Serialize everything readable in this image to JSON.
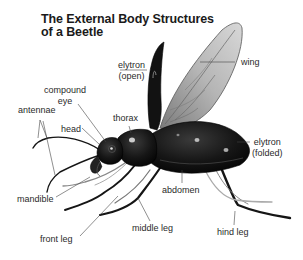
{
  "title": {
    "line1": "The External Body Structures",
    "line2": "of a Beetle"
  },
  "labels": {
    "elytron_open": {
      "line1": "elytron",
      "line2": "(open)"
    },
    "wing": "wing",
    "compound_eye": {
      "line1": "compound",
      "line2": "eye"
    },
    "antennae": "antennae",
    "thorax": "thorax",
    "head": "head",
    "elytron_folded": {
      "line1": "elytron",
      "line2": "(folded)"
    },
    "mandible": "mandible",
    "abdomen": "abdomen",
    "front_leg": "front leg",
    "middle_leg": "middle leg",
    "hind_leg": "hind leg"
  },
  "colors": {
    "background": "#ffffff",
    "body": "#141414",
    "wing": "#9a9a9a",
    "label_text": "#2a2a2a",
    "leader_line": "#555555"
  }
}
